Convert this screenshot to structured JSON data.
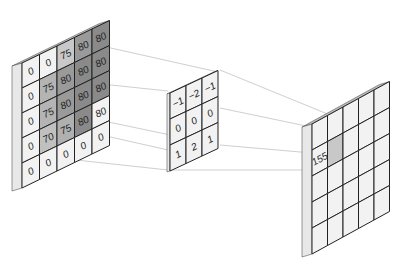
{
  "diagram": {
    "input_matrix": {
      "label": "input",
      "rows": [
        [
          "0",
          "0",
          "75",
          "80",
          "80"
        ],
        [
          "0",
          "75",
          "80",
          "80",
          "80"
        ],
        [
          "0",
          "75",
          "80",
          "80",
          "80"
        ],
        [
          "0",
          "70",
          "75",
          "80",
          "80"
        ],
        [
          "0",
          "0",
          "0",
          "0",
          "0"
        ]
      ],
      "shades": [
        [
          "#f2f2f2",
          "#f2f2f2",
          "#c8c8c8",
          "#9a9a9a",
          "#8a8a8a"
        ],
        [
          "#f2f2f2",
          "#b4b4b4",
          "#9a9a9a",
          "#8a8a8a",
          "#8a8a8a"
        ],
        [
          "#f2f2f2",
          "#b4b4b4",
          "#9a9a9a",
          "#8a8a8a",
          "#8a8a8a"
        ],
        [
          "#f2f2f2",
          "#c0c0c0",
          "#b0b0b0",
          "#8a8a8a",
          "#f2f2f2"
        ],
        [
          "#f2f2f2",
          "#f2f2f2",
          "#f2f2f2",
          "#f2f2f2",
          "#f2f2f2"
        ]
      ]
    },
    "kernel_matrix": {
      "label": "kernel",
      "rows": [
        [
          "−1",
          "−2",
          "−1"
        ],
        [
          "0",
          "0",
          "0"
        ],
        [
          "1",
          "2",
          "1"
        ]
      ]
    },
    "output_matrix": {
      "label": "output",
      "rows": [
        [
          "",
          "",
          "",
          "",
          ""
        ],
        [
          "155",
          "",
          "",
          "",
          ""
        ],
        [
          "",
          "",
          "",
          "",
          ""
        ],
        [
          "",
          "",
          "",
          "",
          ""
        ],
        [
          "",
          "",
          "",
          "",
          ""
        ]
      ],
      "highlight_cell": {
        "row": 1,
        "col": 1,
        "value": "155"
      }
    },
    "colors": {
      "cell_light": "#f2f2f2",
      "edge_top": "#bdbdbd",
      "edge_side": "#e8e8e8",
      "grid_line": "#222222",
      "connector": "#c8c8c8",
      "highlight": "#c8c8c8"
    }
  }
}
